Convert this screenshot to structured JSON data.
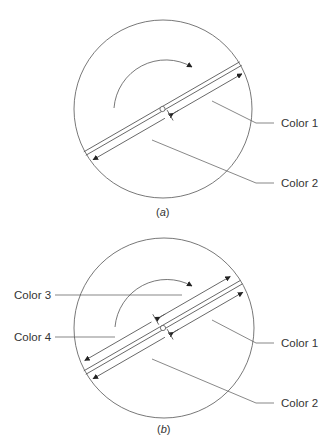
{
  "figure": {
    "colors": {
      "stroke": "#555555",
      "text": "#333333",
      "background": "#ffffff"
    },
    "panel_a": {
      "caption_open": "(",
      "caption_letter": "a",
      "caption_close": ")",
      "labels": [
        "Color 1",
        "Color 2"
      ],
      "rotation_arrow": "clockwise"
    },
    "panel_b": {
      "caption_open": "(",
      "caption_letter": "b",
      "caption_close": ")",
      "labels": [
        "Color 1",
        "Color 2",
        "Color 3",
        "Color 4"
      ],
      "rotation_arrow": "clockwise"
    }
  }
}
